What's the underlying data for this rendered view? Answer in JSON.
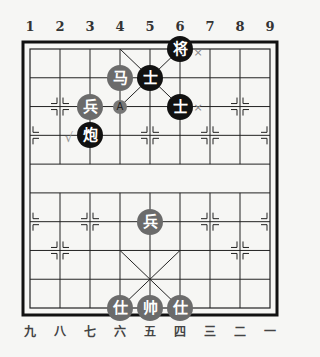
{
  "board": {
    "top_labels": [
      "1",
      "2",
      "3",
      "4",
      "5",
      "6",
      "7",
      "8",
      "9"
    ],
    "bottom_labels": [
      "九",
      "八",
      "七",
      "六",
      "五",
      "四",
      "三",
      "二",
      "一"
    ],
    "colors": {
      "black_piece": "#111111",
      "red_piece": "#6b6b6b",
      "line": "#222222",
      "background": "#f6f6f4"
    }
  },
  "pieces": [
    {
      "label": "将",
      "side": "black",
      "col": 6,
      "row": 0
    },
    {
      "label": "马",
      "side": "red",
      "col": 4,
      "row": 1
    },
    {
      "label": "士",
      "side": "black",
      "col": 5,
      "row": 1
    },
    {
      "label": "兵",
      "side": "red",
      "col": 3,
      "row": 2
    },
    {
      "label": "士",
      "side": "black",
      "col": 6,
      "row": 2
    },
    {
      "label": "炮",
      "side": "black",
      "col": 3,
      "row": 3
    },
    {
      "label": "兵",
      "side": "red",
      "col": 5,
      "row": 6
    },
    {
      "label": "仕",
      "side": "red",
      "col": 4,
      "row": 9
    },
    {
      "label": "帅",
      "side": "red",
      "col": 5,
      "row": 9
    },
    {
      "label": "仕",
      "side": "red",
      "col": 6,
      "row": 9
    }
  ],
  "annotations": [
    {
      "type": "target",
      "label": "A",
      "col": 4,
      "row": 2
    },
    {
      "type": "x-mark",
      "label": "×",
      "col": 6.6,
      "row": 0.1
    },
    {
      "type": "x-mark",
      "label": "×",
      "col": 6.6,
      "row": 2
    },
    {
      "type": "check-mark",
      "label": "√",
      "col": 2.3,
      "row": 3.05
    }
  ]
}
